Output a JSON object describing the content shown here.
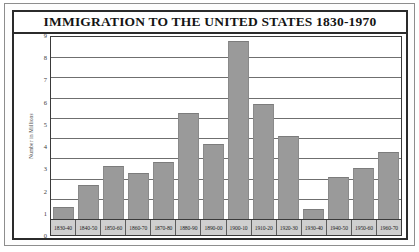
{
  "chart_data": {
    "type": "bar",
    "title": "IMMIGRATION TO THE UNITED STATES 1830-1970",
    "xlabel": "",
    "ylabel": "Number in Millions",
    "ylim": [
      0,
      9
    ],
    "yticks": [
      0,
      1,
      2,
      3,
      4,
      5,
      6,
      7,
      8,
      9
    ],
    "ytick_labels": [
      "0",
      "1",
      "2",
      "3",
      "4",
      "5",
      "6",
      "7",
      "8",
      "9"
    ],
    "grid": true,
    "legend": false,
    "categories": [
      "1830-40",
      "1840-50",
      "1850-60",
      "1860-70",
      "1870-80",
      "1880-90",
      "1890-00",
      "1900-10",
      "1910-20",
      "1920-30",
      "1930-40",
      "1940-50",
      "1950-60",
      "1960-70"
    ],
    "values": [
      0.6,
      1.7,
      2.6,
      2.3,
      2.8,
      5.25,
      3.7,
      8.8,
      5.7,
      4.1,
      0.5,
      2.1,
      2.5,
      3.3
    ],
    "bar_color": "#9a9a9a",
    "axis_color": "#3a3a3a",
    "grid_color": "#6f6f6f",
    "label_strip_color": "#cfcfcf"
  }
}
